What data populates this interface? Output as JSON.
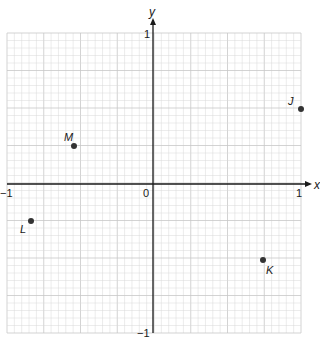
{
  "plot": {
    "x_axis_label": "x",
    "y_axis_label": "y",
    "x_min_label": "−1",
    "x_max_label": "1",
    "y_max_label": "1",
    "y_min_label": "−1",
    "origin_label": "0",
    "grid_color": "#d9d9d9",
    "major_grid_color": "#c8c8c8",
    "axis_color": "#1a1a1a",
    "point_color": "#333333"
  },
  "chart_data": {
    "type": "scatter",
    "title": "",
    "xlabel": "x",
    "ylabel": "y",
    "xlim": [
      -1,
      1
    ],
    "ylim": [
      -1,
      1
    ],
    "grid": true,
    "points": [
      {
        "label": "J",
        "x": 1.0,
        "y": 0.5
      },
      {
        "label": "M",
        "x": -0.55,
        "y": 0.25
      },
      {
        "label": "L",
        "x": -0.85,
        "y": -0.25
      },
      {
        "label": "K",
        "x": 0.75,
        "y": -0.5
      }
    ]
  }
}
